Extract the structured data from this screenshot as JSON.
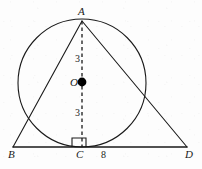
{
  "figure": {
    "kind": "geometry-diagram",
    "canvas": {
      "width": 202,
      "height": 169
    },
    "colors": {
      "background": "#fdfdfd",
      "stroke": "#1a1a1a",
      "label": "#1a1a1a",
      "center_dot": "#000000"
    },
    "points": {
      "A": {
        "label": "A",
        "x": 82,
        "y": 21,
        "label_x": 78,
        "label_y": 6
      },
      "B": {
        "label": "B",
        "x": 13,
        "y": 147,
        "label_x": 8,
        "label_y": 149
      },
      "C": {
        "label": "C",
        "x": 82,
        "y": 147,
        "label_x": 76,
        "label_y": 149
      },
      "D": {
        "label": "D",
        "x": 187,
        "y": 147,
        "label_x": 185,
        "label_y": 149
      },
      "O": {
        "label": "O",
        "x": 82,
        "y": 82,
        "label_x": 70,
        "label_y": 77
      }
    },
    "circle": {
      "cx": 82,
      "cy": 83,
      "r": 64
    },
    "segments": [
      {
        "name": "side-AB",
        "from": "A",
        "to": "B",
        "style": "solid"
      },
      {
        "name": "side-AD",
        "from": "A",
        "to": "D",
        "style": "solid"
      },
      {
        "name": "base-BD",
        "from": "B",
        "to": "D",
        "style": "solid"
      },
      {
        "name": "altitude-AC",
        "from": "A",
        "to": "C",
        "style": "dashed"
      }
    ],
    "right_angle": {
      "at": "C",
      "x": 72,
      "y": 138,
      "size": 9
    },
    "measures": [
      {
        "name": "AO",
        "value": "3",
        "x": 75,
        "y": 54
      },
      {
        "name": "OC",
        "value": "3",
        "x": 75,
        "y": 108
      },
      {
        "name": "CD",
        "value": "8",
        "x": 101,
        "y": 150
      }
    ]
  }
}
